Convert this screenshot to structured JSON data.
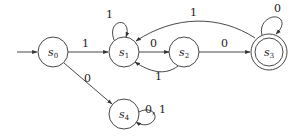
{
  "diagram": {
    "type": "finite-state-automaton",
    "start_state": "s0",
    "states": [
      {
        "id": "s0",
        "name": "s",
        "sub": "0",
        "accepting": false
      },
      {
        "id": "s1",
        "name": "s",
        "sub": "1",
        "accepting": false
      },
      {
        "id": "s2",
        "name": "s",
        "sub": "2",
        "accepting": false
      },
      {
        "id": "s3",
        "name": "s",
        "sub": "3",
        "accepting": true
      },
      {
        "id": "s4",
        "name": "s",
        "sub": "4",
        "accepting": false
      }
    ],
    "transitions": [
      {
        "from": "s0",
        "to": "s1",
        "label": "1"
      },
      {
        "from": "s0",
        "to": "s4",
        "label": "0"
      },
      {
        "from": "s1",
        "to": "s1",
        "label": "1"
      },
      {
        "from": "s1",
        "to": "s2",
        "label": "0"
      },
      {
        "from": "s2",
        "to": "s1",
        "label": "1"
      },
      {
        "from": "s2",
        "to": "s3",
        "label": "0"
      },
      {
        "from": "s3",
        "to": "s1",
        "label": "1"
      },
      {
        "from": "s3",
        "to": "s3",
        "label": "0"
      },
      {
        "from": "s4",
        "to": "s4",
        "label": "0, 1"
      }
    ]
  }
}
